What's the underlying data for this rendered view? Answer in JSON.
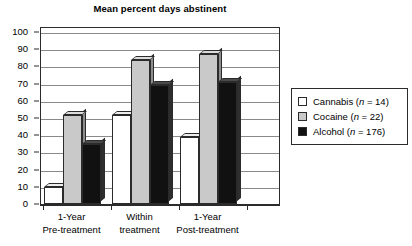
{
  "chart_data": {
    "type": "bar",
    "title": "Mean percent days abstinent",
    "xlabel": "",
    "ylabel": "",
    "ylim": [
      0,
      100
    ],
    "yticks": [
      0,
      10,
      20,
      30,
      40,
      50,
      60,
      70,
      80,
      90,
      100
    ],
    "grid": true,
    "legend_position": "right",
    "categories": [
      "1-Year Pre-treatment",
      "Within treatment",
      "1-Year Post-treatment"
    ],
    "category_lines": [
      [
        "1-Year",
        "Pre-treatment"
      ],
      [
        "Within",
        "treatment"
      ],
      [
        "1-Year",
        "Post-treatment"
      ]
    ],
    "series": [
      {
        "name": "Cannabis (n = 14)",
        "short": "Cannabis",
        "n": 14,
        "color": "#ffffff",
        "values": [
          10,
          52,
          39
        ]
      },
      {
        "name": "Cocaine (n = 22)",
        "short": "Cocaine",
        "n": 22,
        "color": "#c9c9c9",
        "values": [
          52,
          84,
          87
        ]
      },
      {
        "name": "Alcohol (n = 176)",
        "short": "Alcohol",
        "n": 176,
        "color": "#111111",
        "values": [
          35,
          69,
          71
        ]
      }
    ]
  },
  "legend": {
    "items": [
      {
        "label_prefix": "Cannabis (",
        "label_italic": "n",
        "label_suffix": " = 14)",
        "swatch": "#ffffff"
      },
      {
        "label_prefix": "Cocaine (",
        "label_italic": "n",
        "label_suffix": " = 22)",
        "swatch": "#c9c9c9"
      },
      {
        "label_prefix": "Alcohol (",
        "label_italic": "n",
        "label_suffix": " = 176)",
        "swatch": "#111111"
      }
    ]
  },
  "colors": {
    "axis": "#2b2b2b",
    "gridline": "#8a8a8a",
    "background": "#ffffff"
  }
}
